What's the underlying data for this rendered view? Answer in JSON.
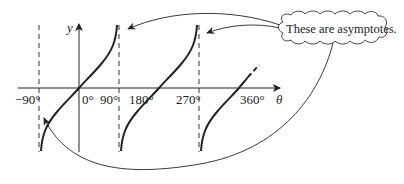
{
  "diagram": {
    "type": "graph-of-tangent",
    "axes": {
      "x_label": "θ",
      "y_label": "y",
      "ticks": [
        {
          "label": "−90°",
          "deg": -90
        },
        {
          "label": "0°",
          "deg": 0
        },
        {
          "label": "90°",
          "deg": 90
        },
        {
          "label": "180°",
          "deg": 180
        },
        {
          "label": "270°",
          "deg": 270
        },
        {
          "label": "360°",
          "deg": 360
        }
      ]
    },
    "asymptotes_deg": [
      -90,
      90,
      270
    ],
    "callout": {
      "text": "These are asymptotes.",
      "shape": "cloud"
    },
    "colors": {
      "ink": "#222222",
      "background": "#ffffff"
    }
  }
}
